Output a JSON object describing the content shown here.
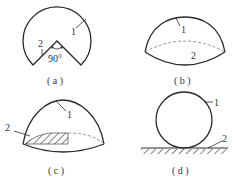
{
  "figure": {
    "panels": [
      {
        "id": "a",
        "caption": "( a )",
        "labels": {
          "one": "1",
          "two": "2",
          "angle": "90°"
        }
      },
      {
        "id": "b",
        "caption": "( b )",
        "labels": {
          "one": "1",
          "two": "2"
        }
      },
      {
        "id": "c",
        "caption": "( c )",
        "labels": {
          "one": "1",
          "two": "2"
        }
      },
      {
        "id": "d",
        "caption": "( d )",
        "labels": {
          "one": "1",
          "two": "2"
        }
      }
    ],
    "colors": {
      "stroke": "#2a2a2a",
      "dash": "#888888",
      "text": "#333333"
    }
  }
}
